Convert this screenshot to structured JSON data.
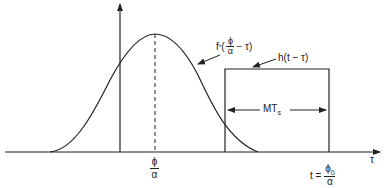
{
  "diagram": {
    "type": "convolution-sketch",
    "axes": {
      "x_label": "τ",
      "vertical_axis_x": 120,
      "horizontal_axis_y": 152
    },
    "curve": {
      "label_f": "f",
      "label_sup": "*",
      "label_open": "(",
      "label_num": "ϕ",
      "label_den": "α",
      "label_tail": "− τ)",
      "peak_x_label_num": "ϕ",
      "peak_x_label_den": "α"
    },
    "window": {
      "label": "h(t − τ)",
      "width_label_main": "MT",
      "width_label_sub": "s",
      "t_label_prefix": "t =",
      "t_label_num": "ϕ",
      "t_label_num_sub": "0",
      "t_label_den": "α"
    },
    "colors": {
      "stroke": "#222222",
      "background": "#ffffff"
    }
  }
}
